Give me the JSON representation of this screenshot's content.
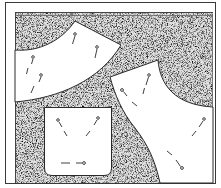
{
  "illustration": {
    "subject": "Sewing pattern pieces pinned to fabric",
    "colors": {
      "background": "#ffffff",
      "fabric_speckle": "#555555",
      "outline": "#2a2a2a",
      "pattern_piece": "#ffffff"
    },
    "pieces": [
      {
        "name": "curved-yoke-piece",
        "pins": 3
      },
      {
        "name": "bodice-piece",
        "pins": 4
      },
      {
        "name": "pocket-piece",
        "pins": 3
      }
    ]
  }
}
